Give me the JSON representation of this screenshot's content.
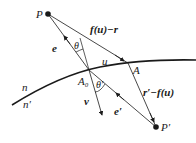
{
  "diagram": {
    "type": "geometry-refraction",
    "colors": {
      "stroke": "#1a1a1a",
      "background": "#ffffff"
    },
    "points": {
      "P": {
        "label": "P",
        "x": 48,
        "y": 14
      },
      "P_prime": {
        "label": "P′",
        "x": 156,
        "y": 127
      },
      "A0": {
        "label": "A₀",
        "x": 89,
        "y": 70
      },
      "A": {
        "label": "A",
        "x": 128,
        "y": 63
      }
    },
    "labels": {
      "f_u_minus_r": "f(u)−r",
      "e": "e",
      "theta": "θ",
      "u": "u",
      "A": "A",
      "n": "n",
      "n_prime": "n′",
      "A0": "A₀",
      "theta_prime": "θ′",
      "nu": "ν",
      "e_prime": "e′",
      "r_prime_minus_f_u": "r′−f(u)",
      "P": "P",
      "P_prime": "P′"
    }
  }
}
